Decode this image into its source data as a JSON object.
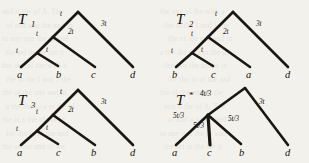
{
  "figure": {
    "name": "phylogenetic-trees-figure",
    "background_color": "#f3f1ec",
    "ink_color": "#1b1714"
  },
  "trees": [
    {
      "id": "T1",
      "title_base": "T",
      "title_sub": "1",
      "leaves": [
        "a",
        "b",
        "c",
        "d"
      ],
      "branch_labels": [
        "t",
        "t",
        "t",
        "2t",
        "3t"
      ]
    },
    {
      "id": "T2",
      "title_base": "T",
      "title_sub": "2",
      "leaves": [
        "b",
        "c",
        "a",
        "d"
      ],
      "branch_labels": [
        "t",
        "t",
        "t",
        "2t",
        "3t"
      ]
    },
    {
      "id": "T3",
      "title_base": "T",
      "title_sub": "3",
      "leaves": [
        "a",
        "c",
        "b",
        "d"
      ],
      "branch_labels": [
        "t",
        "t",
        "t",
        "2t",
        "3t"
      ]
    },
    {
      "id": "Tstar",
      "title_base": "T",
      "title_sub": "*",
      "leaves": [
        "a",
        "c",
        "b",
        "d"
      ],
      "branch_labels": [
        "4t/3",
        "5t/3",
        "5t/3",
        "5t/3",
        "3t"
      ]
    }
  ],
  "labels": {
    "t": "t",
    "two_t": "2t",
    "three_t": "3t",
    "four_t_over_3": "4t/3",
    "five_t_over_3": "5t/3",
    "leaf_a": "a",
    "leaf_b": "b",
    "leaf_c": "c",
    "leaf_d": "d"
  },
  "bleed_through_text": [
    "and it the of A. The",
    "of and a to the and in",
    "to any one the in and",
    "the set in the for it",
    "the one of the with a",
    "the in the I and 1 the",
    "the of the one and in",
    "a the the to a in the of",
    "the in a the of the in",
    "for the in of the and",
    "the of the and of the"
  ]
}
